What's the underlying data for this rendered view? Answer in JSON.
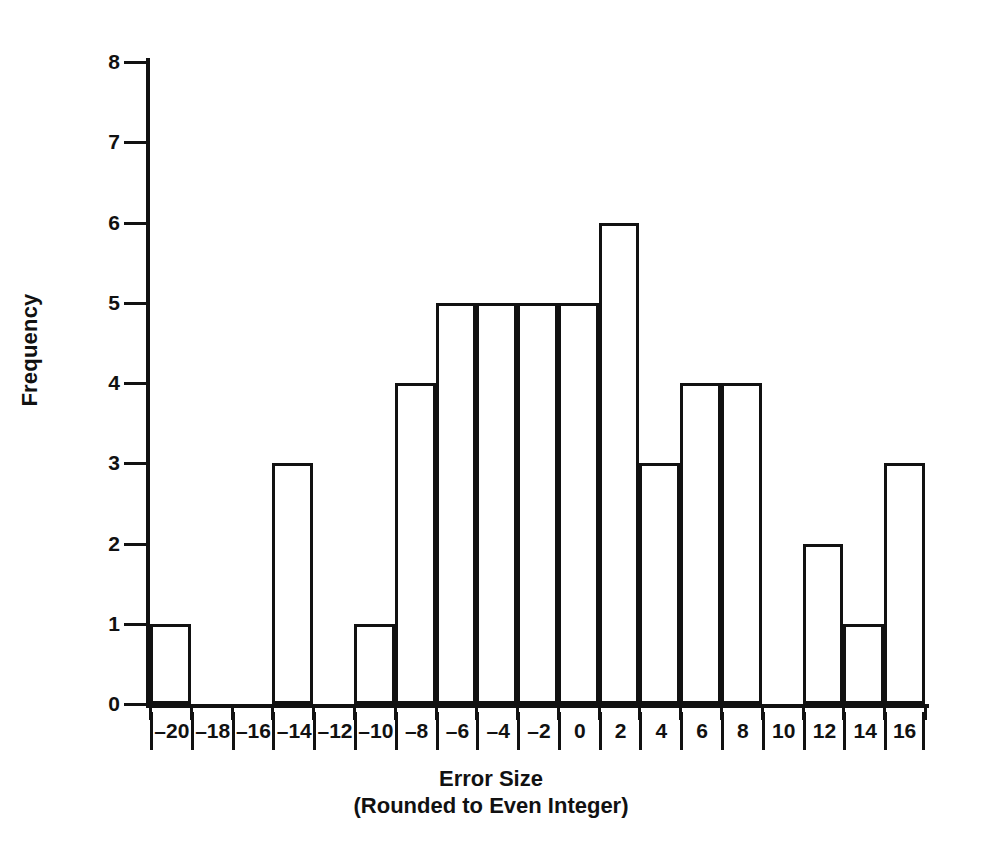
{
  "chart_data": {
    "type": "bar",
    "title": "",
    "xlabel": "Error Size (Rounded to Even Integer)",
    "xlabel_line1": "Error Size",
    "xlabel_line2": "(Rounded to Even Integer)",
    "ylabel": "Frequency",
    "categories": [
      "–20",
      "–18",
      "–16",
      "–14",
      "–12",
      "–10",
      "–8",
      "–6",
      "–4",
      "–2",
      "0",
      "2",
      "4",
      "6",
      "8",
      "10",
      "12",
      "14",
      "16"
    ],
    "values": [
      1,
      0,
      0,
      3,
      0,
      1,
      4,
      5,
      5,
      5,
      5,
      6,
      3,
      4,
      4,
      0,
      2,
      1,
      3
    ],
    "ylim": [
      0,
      8
    ],
    "yticks": [
      0,
      1,
      2,
      3,
      4,
      5,
      6,
      7,
      8
    ],
    "ytick_labels": [
      "0",
      "1",
      "2",
      "3",
      "4",
      "5",
      "6",
      "7",
      "8"
    ],
    "grid": false,
    "legend": null,
    "bar_fill_color": "#ffffff",
    "bar_edge_color": "#111111",
    "axis_color": "#111111",
    "background_color": "#ffffff"
  }
}
